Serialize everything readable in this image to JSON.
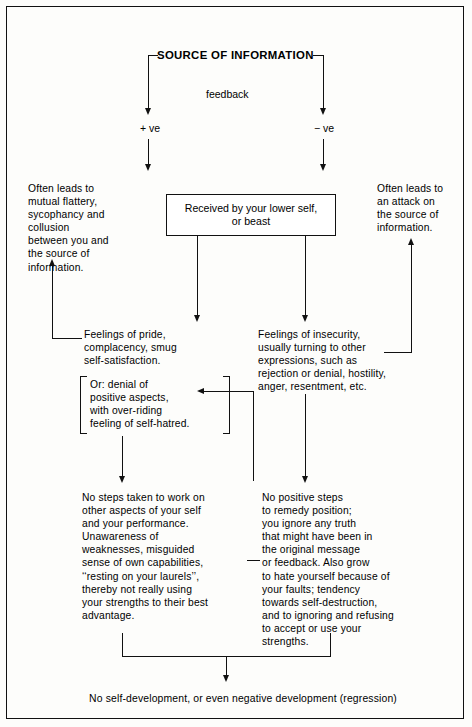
{
  "diagram": {
    "title": "SOURCE OF INFORMATION",
    "feedback_label": "feedback",
    "positive_label": "+ ve",
    "negative_label": "− ve",
    "main_box": "Received by your lower self,\nor beast",
    "left_top": "Often leads to\nmutual flattery,\nsycophancy and\ncollusion\nbetween you and\nthe source of\ninformation.",
    "right_top": "Often leads to\nan attack on\nthe source of\ninformation.",
    "left_mid": "Feelings of pride,\ncomplacency, smug\nself-satisfaction.",
    "left_mid2": "Or: denial of\npositive aspects,\nwith over-riding\nfeeling of self-hatred.",
    "right_mid": "Feelings of insecurity,\nusually turning to other\nexpressions, such as\nrejection or denial, hostility,\nanger, resentment, etc.",
    "left_bottom": "No steps taken to work on\nother aspects of your self\nand your performance.\nUnawareness of\nweaknesses, misguided\nsense of own capabilities,\n‘‘resting on your laurels’’,\nthereby not really using\nyour strengths to their best\nadvantage.",
    "right_bottom": "No positive steps\nto remedy position;\nyou ignore any truth\nthat might have been in\nthe original message\nor feedback. Also grow\nto hate yourself because of\nyour faults; tendency\ntowards self-destruction,\nand to ignoring and refusing\nto accept or use your\nstrengths.",
    "bottom_result": "No self-development, or even negative development (regression)"
  },
  "style": {
    "line_color": "#111111",
    "text_color": "#000000",
    "background": "#fdfdfb"
  }
}
